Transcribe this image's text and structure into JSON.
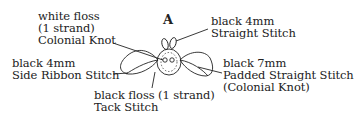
{
  "figure": {
    "title": "A",
    "labels": {
      "colonial_knot": [
        "white floss",
        "(1 strand)",
        "Colonial Knot"
      ],
      "straight_stitch": [
        "black 4mm",
        "Straight Stitch"
      ],
      "side_ribbon": [
        "black  4mm",
        "Side Ribbon Stitch"
      ],
      "padded_straight": [
        "black  7mm",
        "Padded Straight Stitch",
        "(Colonial Knot)"
      ],
      "tack_stitch": [
        "black floss (1 strand)",
        "Tack Stitch"
      ]
    },
    "colors": {
      "line": "#222222",
      "background": "#ffffff"
    }
  }
}
